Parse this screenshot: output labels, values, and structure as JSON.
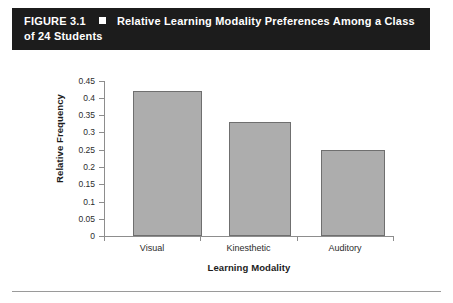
{
  "figure": {
    "label": "FIGURE 3.1",
    "marker": "white-square",
    "title_line1": "Relative Learning Modality Preferences Among a Class",
    "title_line2": "of 24 Students",
    "band_color": "#1c1c1c",
    "band_text_color": "#ffffff"
  },
  "colors": {
    "bar_fill": "#adadad",
    "bar_border": "#6f6f6f",
    "axis": "#8d8d8d",
    "text": "#1c1c1c",
    "page_background": "#ffffff",
    "rule": "#9a9a9a"
  },
  "chart_data": {
    "type": "bar",
    "title": "Relative Learning Modality Preferences Among a Class of 24 Students",
    "categories": [
      "Visual",
      "Kinesthetic",
      "Auditory"
    ],
    "values": [
      0.42,
      0.33,
      0.25
    ],
    "xlabel": "Learning Modality",
    "ylabel": "Relative Frequency",
    "ylim": [
      0,
      0.45
    ],
    "ytick_step": 0.05,
    "ytick_labels": [
      "0.45",
      "0.4",
      "0.35",
      "0.3",
      "0.25",
      "0.2",
      "0.15",
      "0.1",
      "0.05",
      "0"
    ],
    "ytick_values": [
      0.45,
      0.4,
      0.35,
      0.3,
      0.25,
      0.2,
      0.15,
      0.1,
      0.05,
      0
    ],
    "grid": false,
    "legend": "none",
    "orientation": "vertical",
    "n_students": 24
  }
}
